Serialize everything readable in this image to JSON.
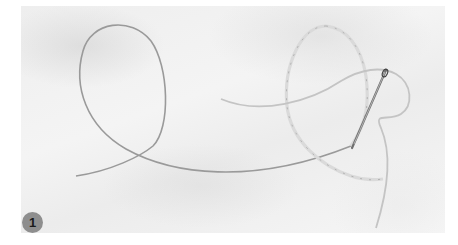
{
  "figure": {
    "step_number": "1",
    "colors": {
      "background": "#ffffff",
      "fabric": "#efefef",
      "thread": "#9a9a9a",
      "thread_light": "#d8d8d8",
      "needle": "#6f6f6f",
      "badge_fill": "#8e8e8e",
      "badge_text": "#1a1a1a"
    }
  }
}
